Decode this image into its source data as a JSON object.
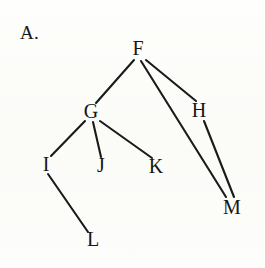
{
  "figure": {
    "panel_label": "A.",
    "background_color": "#fdfdfb",
    "ink_color": "#1a1a1a",
    "width": 265,
    "height": 268
  },
  "chart_data": {
    "type": "diagram",
    "subtype": "node-link-graph",
    "title": "A.",
    "xlabel": "",
    "ylabel": "",
    "grid": false,
    "legend": "none",
    "nodes": [
      {
        "id": "F",
        "label": "F",
        "x": 138,
        "y": 49
      },
      {
        "id": "G",
        "label": "G",
        "x": 91,
        "y": 112
      },
      {
        "id": "H",
        "label": "H",
        "x": 199,
        "y": 111
      },
      {
        "id": "I",
        "label": "I",
        "x": 46,
        "y": 165
      },
      {
        "id": "J",
        "label": "J",
        "x": 101,
        "y": 166
      },
      {
        "id": "K",
        "label": "K",
        "x": 156,
        "y": 167
      },
      {
        "id": "L",
        "label": "L",
        "x": 93,
        "y": 240
      },
      {
        "id": "M",
        "label": "M",
        "x": 232,
        "y": 208
      }
    ],
    "edges": [
      {
        "from": "F",
        "to": "G",
        "x1": 134,
        "y1": 60,
        "x2": 96,
        "y2": 103
      },
      {
        "from": "F",
        "to": "H",
        "x1": 146,
        "y1": 60,
        "x2": 196,
        "y2": 101
      },
      {
        "from": "F",
        "to": "M",
        "x1": 141,
        "y1": 61,
        "x2": 226,
        "y2": 197
      },
      {
        "from": "G",
        "to": "I",
        "x1": 85,
        "y1": 121,
        "x2": 51,
        "y2": 156
      },
      {
        "from": "G",
        "to": "J",
        "x1": 93,
        "y1": 122,
        "x2": 101,
        "y2": 157
      },
      {
        "from": "G",
        "to": "K",
        "x1": 100,
        "y1": 121,
        "x2": 152,
        "y2": 158
      },
      {
        "from": "H",
        "to": "M",
        "x1": 204,
        "y1": 121,
        "x2": 234,
        "y2": 197
      },
      {
        "from": "I",
        "to": "L",
        "x1": 48,
        "y1": 174,
        "x2": 88,
        "y2": 232
      }
    ],
    "node_count": 8,
    "edge_count": 8
  }
}
